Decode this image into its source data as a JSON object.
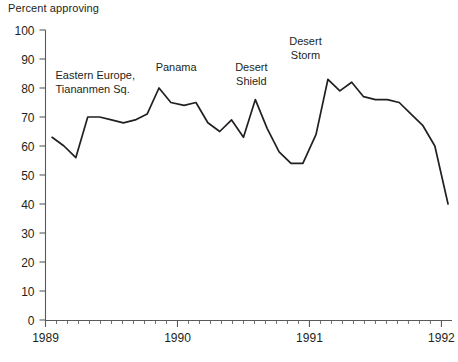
{
  "chart_data": {
    "type": "line",
    "title": "",
    "subtitle": "",
    "ylabel": "Percent approving",
    "xlabel": "",
    "ylim": [
      0,
      100
    ],
    "yticks": [
      0,
      10,
      20,
      30,
      40,
      50,
      60,
      70,
      80,
      90,
      100
    ],
    "xlim": [
      1989.0,
      1992.08
    ],
    "xticks": [
      1989,
      1990,
      1991,
      1992
    ],
    "xtick_labels": [
      "1989",
      "1990",
      "1991",
      "1992"
    ],
    "grid": false,
    "legend": null,
    "minor_xticks_interval_months": 1,
    "line_color": "#231f20",
    "series": [
      {
        "name": "Presidential approval",
        "x": [
          1989.05,
          1989.14,
          1989.23,
          1989.32,
          1989.41,
          1989.5,
          1989.59,
          1989.68,
          1989.77,
          1989.86,
          1989.95,
          1990.05,
          1990.14,
          1990.23,
          1990.32,
          1990.41,
          1990.5,
          1990.59,
          1990.68,
          1990.77,
          1990.86,
          1990.95,
          1991.05,
          1991.14,
          1991.23,
          1991.32,
          1991.41,
          1991.5,
          1991.59,
          1991.68,
          1991.77,
          1991.86,
          1991.95,
          1992.05
        ],
        "y": [
          63,
          60,
          56,
          70,
          70,
          69,
          68,
          69,
          71,
          80,
          75,
          74,
          75,
          68,
          65,
          69,
          63,
          76,
          66,
          58,
          54,
          54,
          64,
          83,
          79,
          82,
          77,
          76,
          76,
          75,
          71,
          67,
          60,
          40
        ],
        "y_units": "percent"
      }
    ],
    "annotations": [
      {
        "text_lines": [
          "Eastern Europe,",
          "Tiananmen Sq."
        ],
        "x": 1989.47,
        "y": 83
      },
      {
        "text_lines": [
          "Panama"
        ],
        "x": 1989.99,
        "y": 86
      },
      {
        "text_lines": [
          "Desert",
          "Shield"
        ],
        "x": 1990.56,
        "y": 86
      },
      {
        "text_lines": [
          "Desert",
          "Storm"
        ],
        "x": 1990.97,
        "y": 95
      }
    ]
  }
}
